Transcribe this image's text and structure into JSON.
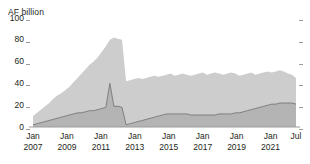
{
  "axis": {
    "unit_label": "AF billion",
    "y_ticks": [
      "100",
      "80",
      "60",
      "40",
      "20",
      "0"
    ],
    "y_tick_values": [
      100,
      80,
      60,
      40,
      20,
      0
    ],
    "x_ticks": [
      {
        "month": "Jan",
        "year": "2007"
      },
      {
        "month": "Jan",
        "year": "2009"
      },
      {
        "month": "Jan",
        "year": "2011"
      },
      {
        "month": "Jan",
        "year": "2013"
      },
      {
        "month": "Jan",
        "year": "2015"
      },
      {
        "month": "Jan",
        "year": "2017"
      },
      {
        "month": "Jan",
        "year": "2019"
      },
      {
        "month": "Jan",
        "year": "2021"
      },
      {
        "month": "Jul",
        "year": ""
      }
    ]
  },
  "colors": {
    "series_upper_fill": "#cdcdcd",
    "series_lower_fill": "#b4b4b4",
    "series_line": "#6f6f6f",
    "axis": "#9b9b9b",
    "text": "#231f20",
    "background": "#ffffff"
  },
  "chart_data": {
    "type": "area",
    "title": "",
    "subtitle": "",
    "xlabel": "",
    "ylabel": "AF billion",
    "ylim": [
      0,
      100
    ],
    "xlim": [
      "2007-01",
      "2022-07"
    ],
    "grid": false,
    "legend": "none",
    "stacked": false,
    "x_tick_labels": [
      "Jan 2007",
      "Jan 2009",
      "Jan 2011",
      "Jan 2013",
      "Jan 2015",
      "Jan 2017",
      "Jan 2019",
      "Jan 2021",
      "Jul"
    ],
    "y_tick_labels": [
      "0",
      "20",
      "40",
      "60",
      "80",
      "100"
    ],
    "x": [
      "2007-01",
      "2007-04",
      "2007-07",
      "2007-10",
      "2008-01",
      "2008-04",
      "2008-07",
      "2008-10",
      "2009-01",
      "2009-04",
      "2009-07",
      "2009-10",
      "2010-01",
      "2010-04",
      "2010-07",
      "2010-10",
      "2011-01",
      "2011-04",
      "2011-07",
      "2011-09",
      "2011-10",
      "2011-11",
      "2011-12",
      "2012-01",
      "2012-04",
      "2012-07",
      "2012-10",
      "2013-01",
      "2013-04",
      "2013-07",
      "2013-10",
      "2014-01",
      "2014-04",
      "2014-07",
      "2014-10",
      "2015-01",
      "2015-04",
      "2015-07",
      "2015-10",
      "2016-01",
      "2016-04",
      "2016-07",
      "2016-10",
      "2017-01",
      "2017-04",
      "2017-07",
      "2017-10",
      "2018-01",
      "2018-04",
      "2018-07",
      "2018-10",
      "2019-01",
      "2019-04",
      "2019-07",
      "2019-10",
      "2020-01",
      "2020-04",
      "2020-07",
      "2020-10",
      "2021-01",
      "2021-04",
      "2021-07",
      "2021-10",
      "2022-01",
      "2022-04",
      "2022-07"
    ],
    "series": [
      {
        "name": "Total",
        "fill": "#cdcdcd",
        "values": [
          10,
          13,
          16,
          19,
          22,
          26,
          29,
          31,
          34,
          37,
          41,
          45,
          49,
          53,
          57,
          60,
          64,
          69,
          74,
          80,
          82,
          81,
          80,
          42,
          43,
          44,
          45,
          44,
          45,
          46,
          47,
          46,
          47,
          48,
          49,
          47,
          48,
          49,
          48,
          47,
          48,
          49,
          50,
          48,
          49,
          50,
          49,
          48,
          49,
          50,
          49,
          47,
          48,
          49,
          50,
          48,
          49,
          50,
          51,
          50,
          51,
          52,
          51,
          49,
          48,
          45
        ]
      },
      {
        "name": "Lower band",
        "fill": "#b4b4b4",
        "line": "#6f6f6f",
        "values": [
          2,
          3,
          4,
          5,
          6,
          7,
          8,
          9,
          10,
          11,
          12,
          13,
          13,
          14,
          15,
          15,
          16,
          17,
          18,
          40,
          19,
          19,
          18,
          2,
          3,
          4,
          5,
          6,
          7,
          8,
          9,
          10,
          11,
          12,
          12,
          12,
          12,
          12,
          12,
          11,
          11,
          11,
          11,
          11,
          11,
          11,
          12,
          12,
          12,
          12,
          13,
          13,
          14,
          15,
          16,
          17,
          18,
          19,
          20,
          21,
          21,
          22,
          22,
          22,
          22,
          21
        ]
      }
    ],
    "annotations": [
      {
        "text": "peak",
        "x": "2011-10",
        "value": 82
      },
      {
        "text": "spike in lower band",
        "x": "2011-09",
        "value": 40
      },
      {
        "text": "sharp drop",
        "x": "2012-01",
        "value": 42
      }
    ]
  }
}
